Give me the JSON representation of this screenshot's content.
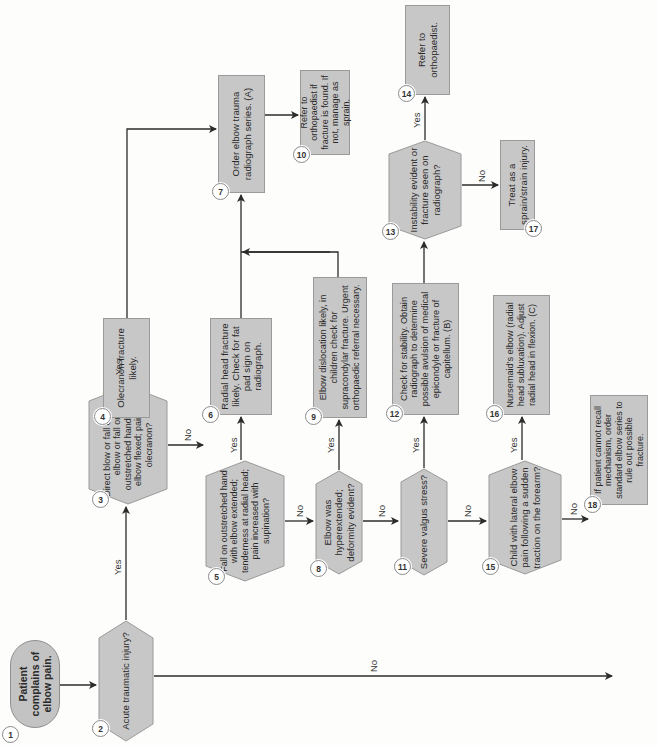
{
  "diagram": {
    "type": "flowchart",
    "orientation": "rotated-90-ccw",
    "colors": {
      "node_fill": "#c7c7c7",
      "node_border": "#9a9a9a",
      "line": "#2b2b2b",
      "background": "#fdfdfc"
    },
    "nodes": [
      {
        "id": 1,
        "shape": "terminator",
        "text": "Patient complains of elbow pain."
      },
      {
        "id": 2,
        "shape": "decision",
        "text": "Acute traumatic injury?"
      },
      {
        "id": 3,
        "shape": "decision",
        "text": "Direct blow or fall on tip of elbow or fall on outstretched hand with elbow flexed; pain at olecranon?"
      },
      {
        "id": 4,
        "shape": "process",
        "text": "Olecranon fracture likely."
      },
      {
        "id": 5,
        "shape": "decision",
        "text": "Fall on outstretched hand with elbow extended; tenderness at radial head; pain increased with supination?"
      },
      {
        "id": 6,
        "shape": "process",
        "text": "Radial head fracture likely. Check for fat pad sign on radiograph."
      },
      {
        "id": 7,
        "shape": "process",
        "text": "Order elbow trauma radiograph series. (A)"
      },
      {
        "id": 8,
        "shape": "decision",
        "text": "Elbow was hyperextended; deformity evident?"
      },
      {
        "id": 9,
        "shape": "process",
        "text": "Elbow dislocation likely, in children check for supracondylar fracture. Urgent orthopaedic referral necessary."
      },
      {
        "id": 10,
        "shape": "process",
        "text": "Refer to orthopaedist if fracture is found. If not, manage as sprain."
      },
      {
        "id": 11,
        "shape": "decision",
        "text": "Severe valgus stress?"
      },
      {
        "id": 12,
        "shape": "process",
        "text": "Check for stability. Obtain radiograph to determine possible avulsion of medical epicondyle or fracture of capitellum. (B)"
      },
      {
        "id": 13,
        "shape": "decision",
        "text": "Instability evident or fracture seen on radiograph?"
      },
      {
        "id": 14,
        "shape": "process",
        "text": "Refer to orthopaedist."
      },
      {
        "id": 15,
        "shape": "decision",
        "text": "Child with lateral elbow pain following a sudden traction on the forearm?"
      },
      {
        "id": 16,
        "shape": "process",
        "text": "Nursemaid's elbow (radial head subluxation). Adjust radial head in flexion. (C)"
      },
      {
        "id": 17,
        "shape": "process",
        "text": "Treat as a sprain/strain injury."
      },
      {
        "id": 18,
        "shape": "process",
        "text": "If patient cannot recall mechanism, order standard elbow series to rule out possible fracture."
      }
    ],
    "edges": [
      {
        "from": 1,
        "to": 2,
        "label": ""
      },
      {
        "from": 2,
        "to": 3,
        "label": "Yes"
      },
      {
        "from": 2,
        "to": "off-page",
        "label": "No"
      },
      {
        "from": 3,
        "to": 4,
        "label": "Yes"
      },
      {
        "from": 3,
        "to": 5,
        "label": "No"
      },
      {
        "from": 4,
        "to": 7,
        "label": ""
      },
      {
        "from": 5,
        "to": 6,
        "label": "Yes"
      },
      {
        "from": 5,
        "to": 8,
        "label": "No"
      },
      {
        "from": 6,
        "to": 7,
        "label": ""
      },
      {
        "from": 7,
        "to": 10,
        "label": ""
      },
      {
        "from": 8,
        "to": 9,
        "label": "Yes"
      },
      {
        "from": 8,
        "to": 11,
        "label": "No"
      },
      {
        "from": 9,
        "to": 7,
        "label": ""
      },
      {
        "from": 11,
        "to": 12,
        "label": "Yes"
      },
      {
        "from": 11,
        "to": 15,
        "label": "No"
      },
      {
        "from": 12,
        "to": 13,
        "label": ""
      },
      {
        "from": 13,
        "to": 14,
        "label": "Yes"
      },
      {
        "from": 13,
        "to": 17,
        "label": "No"
      },
      {
        "from": 15,
        "to": 16,
        "label": "Yes"
      },
      {
        "from": 15,
        "to": 18,
        "label": "No"
      }
    ],
    "labels": {
      "yes": "Yes",
      "no": "No"
    }
  }
}
